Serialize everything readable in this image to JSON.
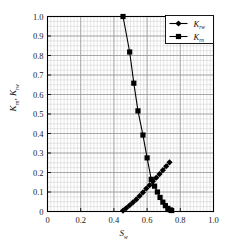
{
  "figure": {
    "background": "#ffffff",
    "frame_color": "#000000",
    "grid_major_color": "#999999",
    "grid_minor_color": "#cccccc"
  },
  "axes": {
    "x_ticks": [
      "0",
      "0.2",
      "0.4",
      "0.6",
      "0.8",
      "1.0"
    ],
    "x_tick_values": [
      0,
      0.2,
      0.4,
      0.6,
      0.8,
      1.0
    ],
    "y_ticks": [
      "0",
      "0.1",
      "0.2",
      "0.3",
      "0.4",
      "0.5",
      "0.6",
      "0.7",
      "0.8",
      "0.9",
      "1.0"
    ],
    "y_tick_values": [
      0,
      0.1,
      0.2,
      0.3,
      0.4,
      0.5,
      0.6,
      0.7,
      0.8,
      0.9,
      1.0
    ]
  },
  "legend": {
    "position": "top-right",
    "entries": [
      {
        "label_main": "K",
        "label_sub": "rw",
        "marker": "diamond"
      },
      {
        "label_main": "K",
        "label_sub": "rn",
        "marker": "square"
      }
    ]
  },
  "chart_data": {
    "type": "line",
    "title": "",
    "xlabel_main": "S",
    "xlabel_sub": "w",
    "ylabel_main_1": "K",
    "ylabel_sub_1": "rn",
    "ylabel_sep": ", ",
    "ylabel_main_2": "K",
    "ylabel_sub_2": "rw",
    "xlim": [
      0,
      1.0
    ],
    "ylim": [
      0,
      1.0
    ],
    "grid": true,
    "grid_minor_x_step": 0.02,
    "grid_minor_y_step": 0.025,
    "grid_major_x_step": 0.1,
    "grid_major_y_step": 0.1,
    "legend_position": "upper right",
    "series": [
      {
        "name": "Krw",
        "marker": "diamond",
        "color": "#000000",
        "x": [
          0.455,
          0.475,
          0.495,
          0.515,
          0.535,
          0.555,
          0.575,
          0.595,
          0.615,
          0.635,
          0.655,
          0.675,
          0.695,
          0.715,
          0.735
        ],
        "y": [
          0.005,
          0.018,
          0.032,
          0.047,
          0.062,
          0.08,
          0.098,
          0.118,
          0.135,
          0.155,
          0.173,
          0.192,
          0.212,
          0.232,
          0.252
        ]
      },
      {
        "name": "Krn",
        "marker": "square",
        "color": "#000000",
        "x": [
          0.455,
          0.495,
          0.52,
          0.545,
          0.575,
          0.6,
          0.625,
          0.645,
          0.662,
          0.678,
          0.695,
          0.71,
          0.725,
          0.74,
          0.748
        ],
        "y": [
          1.0,
          0.818,
          0.658,
          0.516,
          0.392,
          0.275,
          0.165,
          0.13,
          0.1,
          0.072,
          0.048,
          0.03,
          0.016,
          0.008,
          0.005
        ]
      }
    ]
  }
}
